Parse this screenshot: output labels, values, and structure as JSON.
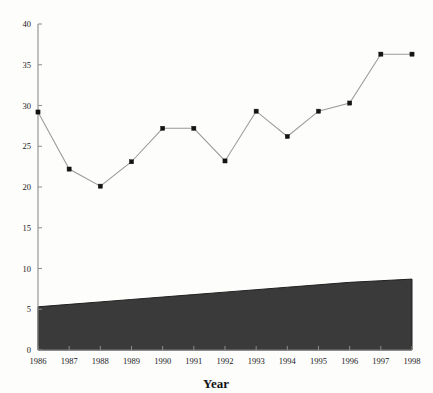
{
  "chart_data": {
    "type": "line",
    "title": "",
    "subtitle": "",
    "xlabel": "Year",
    "ylabel": "",
    "categories": [
      "1986",
      "1987",
      "1988",
      "1989",
      "1990",
      "1991",
      "1992",
      "1993",
      "1994",
      "1995",
      "1996",
      "1997",
      "1998"
    ],
    "x": [
      1986,
      1987,
      1988,
      1989,
      1990,
      1991,
      1992,
      1993,
      1994,
      1995,
      1996,
      1997,
      1998
    ],
    "values": [
      29.2,
      22.2,
      20.1,
      23.1,
      27.2,
      27.2,
      23.2,
      29.3,
      26.2,
      29.3,
      30.3,
      36.3,
      36.3
    ],
    "series": [
      {
        "name": "line-series",
        "marker": "square",
        "color": "#141414",
        "values": [
          29.2,
          22.2,
          20.1,
          23.1,
          27.2,
          27.2,
          23.2,
          29.3,
          26.2,
          29.3,
          30.3,
          36.3,
          36.3
        ]
      },
      {
        "name": "shaded-band",
        "type": "area",
        "color": "#3a3a3a",
        "baseline": 0,
        "values": [
          5.3,
          5.6,
          5.9,
          6.2,
          6.5,
          6.8,
          7.1,
          7.4,
          7.7,
          8.0,
          8.3,
          8.5,
          8.7
        ]
      }
    ],
    "xlim": [
      1986,
      1998
    ],
    "ylim": [
      0,
      40
    ],
    "yticks": [
      0,
      5,
      10,
      15,
      20,
      25,
      30,
      35,
      40
    ],
    "ytick_labels": [
      "0",
      "5",
      "10",
      "15",
      "20",
      "25",
      "30",
      "35",
      "40"
    ],
    "xtick_labels": [
      "1986",
      "1987",
      "1988",
      "1989",
      "1990",
      "1991",
      "1992",
      "1993",
      "1994",
      "1995",
      "1996",
      "1997",
      "1998"
    ],
    "grid": false,
    "legend": "none",
    "annotations": []
  },
  "axes": {
    "x_title": "Year",
    "y_title": ""
  },
  "colors": {
    "line": "#9a9a9a",
    "marker": "#141414",
    "band": "#3a3a3a",
    "axis": "#8c8c8c",
    "background": "#fdfdfc"
  }
}
